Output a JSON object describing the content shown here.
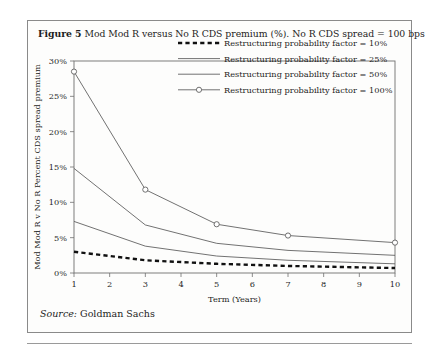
{
  "figure": {
    "label": "Figure 5",
    "caption": "Mod Mod R versus No R CDS premium (%). No R CDS spread = 100 bps",
    "source_key": "Source:",
    "source_value": "Goldman Sachs"
  },
  "chart_data": {
    "type": "line",
    "title": "Mod Mod R versus No R CDS premium (%). No R CDS spread = 100 bps",
    "xlabel": "Term (Years)",
    "ylabel": "Mod Mod R v No R Percent CDS spread premium",
    "xlim": [
      1,
      10
    ],
    "ylim": [
      0,
      30
    ],
    "xticks": [
      1,
      2,
      3,
      4,
      5,
      6,
      7,
      8,
      9,
      10
    ],
    "xticklabels": [
      "1",
      "2",
      "3",
      "4",
      "5",
      "6",
      "7",
      "8",
      "9",
      "10"
    ],
    "yticks": [
      0,
      5,
      10,
      15,
      20,
      25,
      30
    ],
    "yticklabels": [
      "0%",
      "5%",
      "10%",
      "15%",
      "20%",
      "25%",
      "30%"
    ],
    "grid": false,
    "legend_position": "upper right",
    "x": [
      1,
      3,
      5,
      7,
      10
    ],
    "series": [
      {
        "name": "Restructuring probability factor = 10%",
        "style": "dashed",
        "marker": "none",
        "values": [
          3.0,
          1.8,
          1.3,
          1.0,
          0.7
        ]
      },
      {
        "name": "Restructuring probability factor = 25%",
        "style": "solid",
        "marker": "none",
        "values": [
          7.3,
          3.8,
          2.4,
          1.8,
          1.3
        ]
      },
      {
        "name": "Restructuring probability factor = 50%",
        "style": "solid",
        "marker": "none",
        "values": [
          14.8,
          6.8,
          4.2,
          3.2,
          2.5
        ]
      },
      {
        "name": "Restructuring probability factor = 100%",
        "style": "solid",
        "marker": "circle",
        "values": [
          28.5,
          11.8,
          6.9,
          5.3,
          4.3
        ]
      }
    ]
  }
}
